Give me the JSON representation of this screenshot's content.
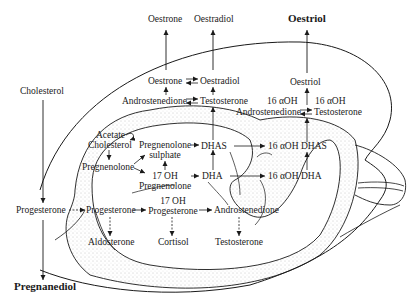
{
  "labels": {
    "oestrone_top": "Oestrone",
    "oestradiol_top": "Oestradiol",
    "oestriol_top": "Oestriol",
    "cholesterol_maternal": "Cholesterol",
    "oestrone": "Oestrone",
    "oestradiol": "Oestradiol",
    "androstenedione_placenta": "Androstenedione",
    "testosterone_placenta": "Testosterone",
    "oestriol": "Oestriol",
    "oh16_left": "16 αOH",
    "oh16_right": "16 αOH",
    "androstenedione_16": "Androstenedione",
    "testosterone_16": "Testosterone",
    "acetate": "Acetate",
    "cholesterol_fetal": "Cholesterol",
    "pregnenolone_sulphate_1": "Pregnenolone",
    "pregnenolone_sulphate_2": "sulphate",
    "dhas": "DHAS",
    "oh_dhas": "16 αOH DHAS",
    "pregnenolone": "Pregnenolone",
    "oh17_pregnenolone_1": "17 OH",
    "oh17_pregnenolone_2": "Pregnenolone",
    "dha": "DHA",
    "oh_dha": "16 αOH DHA",
    "progesterone_maternal": "Progesterone",
    "progesterone_fetal": "Progesterone",
    "oh17_progesterone_1": "17 OH",
    "oh17_progesterone_2": "Progesterone",
    "androstenedione_fetal": "Androstenedione",
    "aldosterone": "Aldosterone",
    "cortisol": "Cortisol",
    "testosterone_fetal": "Testosterone",
    "pregnanediol": "Pregnanediol"
  },
  "colors": {
    "ink": "#1a1a1a",
    "stipple": "#9a9a9a",
    "background": "#ffffff"
  }
}
